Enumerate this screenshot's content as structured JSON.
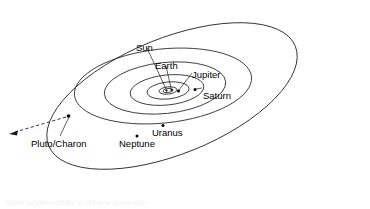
{
  "figure": {
    "kind": "solar-system-orbit-diagram",
    "title": "Solar system orbits in oblique projection",
    "background_color": "#ffffff",
    "line_color": "#1a1a1a",
    "text_color": "#000000"
  },
  "labels": {
    "sun": "Sun",
    "earth": "Earth",
    "jupiter": "Jupiter",
    "saturn": "Saturn",
    "uranus": "Uranus",
    "neptune": "Neptune",
    "pluto_charon": "Pluto/Charon"
  },
  "label_positions": {
    "sun": {
      "x": 136,
      "y": 43
    },
    "earth": {
      "x": 155,
      "y": 61
    },
    "jupiter": {
      "x": 192,
      "y": 70
    },
    "saturn": {
      "x": 203,
      "y": 91
    },
    "uranus": {
      "x": 152,
      "y": 128
    },
    "neptune": {
      "x": 119,
      "y": 139
    },
    "pluto_charon": {
      "x": 31,
      "y": 139
    }
  },
  "bodies": [
    {
      "name": "Sun",
      "x": 166.5,
      "y": 90.5,
      "r": 1.1
    },
    {
      "name": "Earth",
      "x": 171.5,
      "y": 90.0,
      "r": 1.1
    },
    {
      "name": "Jupiter",
      "x": 178.5,
      "y": 91.0,
      "r": 1.5
    },
    {
      "name": "Saturn",
      "x": 195.0,
      "y": 89.5,
      "r": 1.5
    },
    {
      "name": "Uranus",
      "x": 163.0,
      "y": 125.5,
      "r": 1.5
    },
    {
      "name": "Neptune",
      "x": 137.0,
      "y": 136.0,
      "r": 1.5
    },
    {
      "name": "Pluto/Charon",
      "x": 68.5,
      "y": 116.0,
      "r": 1.8
    }
  ],
  "orbits": [
    {
      "name": "inner-planets-1",
      "cx": 168,
      "cy": 90.5,
      "rx": 5,
      "ry": 2,
      "rotation": -6
    },
    {
      "name": "inner-planets-2",
      "cx": 168,
      "cy": 90.5,
      "rx": 9,
      "ry": 3.6,
      "rotation": -6
    },
    {
      "name": "jupiter",
      "cx": 168,
      "cy": 90.5,
      "rx": 21,
      "ry": 8.5,
      "rotation": -6
    },
    {
      "name": "saturn",
      "cx": 167,
      "cy": 90.0,
      "rx": 37,
      "ry": 15,
      "rotation": -6
    },
    {
      "name": "uranus",
      "cx": 165,
      "cy": 88.0,
      "rx": 61,
      "ry": 25.5,
      "rotation": -6
    },
    {
      "name": "neptune",
      "cx": 163,
      "cy": 86.0,
      "rx": 89,
      "ry": 37,
      "rotation": -6
    },
    {
      "name": "pluto-charon",
      "cx": 172,
      "cy": 96.0,
      "rx": 133,
      "ry": 58,
      "rotation": -22
    }
  ],
  "leader_lines": [
    {
      "name": "sun-leader",
      "x1": 147,
      "y1": 48,
      "x2": 166,
      "y2": 89
    },
    {
      "name": "earth-leader",
      "x1": 166,
      "y1": 66,
      "x2": 171,
      "y2": 88
    },
    {
      "name": "jupiter-leader",
      "x1": 192,
      "y1": 73,
      "x2": 179,
      "y2": 90
    },
    {
      "name": "saturn-leader",
      "x1": 202,
      "y1": 88,
      "x2": 196,
      "y2": 89
    },
    {
      "name": "pluto-leader",
      "x1": 60,
      "y1": 136,
      "x2": 69,
      "y2": 117
    }
  ],
  "direction_arrow": {
    "name": "motion-direction-arrow",
    "style": "dashed",
    "x1": 66,
    "y1": 117,
    "x2": 12,
    "y2": 133
  },
  "caption_ghost": "a faint show-through of text from the reverse side of the page"
}
